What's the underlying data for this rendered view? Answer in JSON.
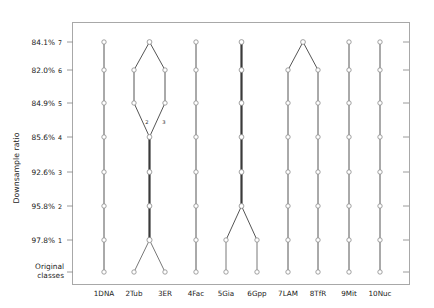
{
  "chart_data": {
    "type": "diagram",
    "title": "",
    "ylabel": "Downsample ratio",
    "xlabel": "",
    "grid": false,
    "legend": "none",
    "y_levels": [
      {
        "level": "7",
        "ratio": "84.1%",
        "y": 42
      },
      {
        "level": "6",
        "ratio": "82.0%",
        "y": 70
      },
      {
        "level": "5",
        "ratio": "84.9%",
        "y": 103
      },
      {
        "level": "4",
        "ratio": "85.6%",
        "y": 137
      },
      {
        "level": "3",
        "ratio": "92.6%",
        "y": 172
      },
      {
        "level": "2",
        "ratio": "95.8%",
        "y": 206
      },
      {
        "level": "1",
        "ratio": "97.8%",
        "y": 240
      },
      {
        "level": "0",
        "ratio": "Original classes",
        "y": 272
      }
    ],
    "categories": [
      "1DNA",
      "2Tub",
      "3ER",
      "4Fac",
      "5Gia",
      "6Gpp",
      "7LAM",
      "8TfR",
      "9Mit",
      "10Nuc"
    ],
    "column_x": [
      104,
      134,
      165,
      196,
      226,
      257,
      288,
      318,
      349,
      380
    ],
    "node_annotations": [
      {
        "text": "2",
        "x": 147,
        "y": 124
      },
      {
        "text": "3",
        "x": 164,
        "y": 124
      }
    ],
    "edges_desc": "merge tree: cols 2&3 merge at level 4 then trunk to level 1 then split; cols 5&6 merge at level 2; cols 7&8 merge at level 7",
    "colors": {
      "line": "#555555",
      "trunk": "#3a3a3a",
      "node_stroke": "#8a8a8a",
      "axis": "#8f8f8f",
      "text": "#1a1a1a"
    }
  }
}
